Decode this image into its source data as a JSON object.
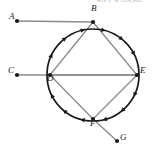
{
  "image": {
    "type": "geometry-diagram",
    "width": 154,
    "height": 155,
    "background": "#ffffff",
    "cropped_caption_fragment": "ANY A GAME"
  },
  "colors": {
    "circle_stroke": "#1a1a1a",
    "chord_stroke": "#8c8c8c",
    "ray_stroke": "#8c8c8c",
    "point_fill": "#1a1a1a",
    "label_text": "#222222"
  },
  "diagram": {
    "circle": {
      "cx": 93,
      "cy": 75,
      "r": 46,
      "direction": "clockwise"
    },
    "points": [
      {
        "id": "A",
        "label": "A",
        "x": 17,
        "y": 21,
        "on_circle": false,
        "label_dx": -8,
        "label_dy": -4
      },
      {
        "id": "B",
        "label": "B",
        "x": 93,
        "y": 22,
        "on_circle": true,
        "label_dx": -2,
        "label_dy": -13
      },
      {
        "id": "C",
        "label": "C",
        "x": 17,
        "y": 75,
        "on_circle": false,
        "label_dx": -9,
        "label_dy": -4
      },
      {
        "id": "D",
        "label": "D",
        "x": 50,
        "y": 75,
        "on_circle": true,
        "label_dx": -3,
        "label_dy": 4
      },
      {
        "id": "E",
        "label": "E",
        "x": 137,
        "y": 75,
        "on_circle": true,
        "label_dx": 3,
        "label_dy": -4
      },
      {
        "id": "F",
        "label": "F",
        "x": 93,
        "y": 119,
        "on_circle": true,
        "label_dx": -3,
        "label_dy": 5
      },
      {
        "id": "G",
        "label": "G",
        "x": 117,
        "y": 141,
        "on_circle": false,
        "label_dx": 3,
        "label_dy": -3
      }
    ],
    "chords": [
      {
        "from": "B",
        "to": "D"
      },
      {
        "from": "B",
        "to": "E"
      },
      {
        "from": "D",
        "to": "E"
      },
      {
        "from": "D",
        "to": "F"
      },
      {
        "from": "F",
        "to": "E"
      }
    ],
    "rays": [
      {
        "from": "A",
        "to": "B"
      },
      {
        "from": "C",
        "to": "E"
      },
      {
        "from": "F",
        "to": "G"
      }
    ],
    "arrowheads_on_circle": [
      {
        "angle_deg": 205,
        "direction": "clockwise"
      },
      {
        "angle_deg": 232,
        "direction": "clockwise"
      },
      {
        "angle_deg": 257,
        "direction": "clockwise"
      },
      {
        "angle_deg": 283,
        "direction": "clockwise"
      },
      {
        "angle_deg": 308,
        "direction": "clockwise"
      },
      {
        "angle_deg": 332,
        "direction": "clockwise"
      },
      {
        "angle_deg": 25,
        "direction": "clockwise"
      },
      {
        "angle_deg": 50,
        "direction": "clockwise"
      },
      {
        "angle_deg": 75,
        "direction": "clockwise"
      },
      {
        "angle_deg": 103,
        "direction": "clockwise"
      },
      {
        "angle_deg": 128,
        "direction": "clockwise"
      },
      {
        "angle_deg": 153,
        "direction": "clockwise"
      }
    ]
  }
}
